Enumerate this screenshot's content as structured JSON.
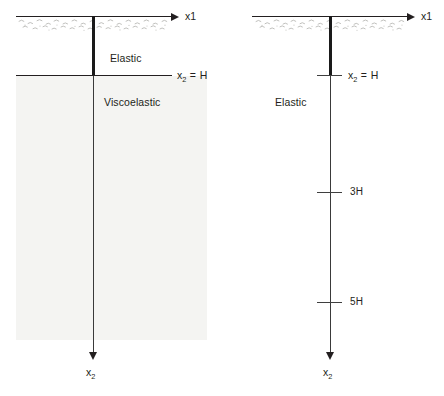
{
  "figure": {
    "background_color": "#ffffff",
    "line_color": "#231f20",
    "shade_color": "#f4f4f2"
  },
  "panels": [
    {
      "id": "left",
      "name": "elastic-layer-over-viscoelastic-halfspace",
      "axes": {
        "horizontal_label": "x1",
        "vertical_label_main": "x",
        "vertical_label_sub": "2"
      },
      "regions": [
        {
          "name": "elastic",
          "label": "Elastic",
          "shaded": false
        },
        {
          "name": "viscoelastic",
          "label": "Viscoelastic",
          "shaded": true
        }
      ],
      "interface": {
        "name": "depth-H-interface",
        "label_main": "x",
        "label_sub": "2",
        "label_eq": " = H",
        "style": "full-horizontal-line"
      },
      "ticks": []
    },
    {
      "id": "right",
      "name": "uniform-elastic-halfspace",
      "axes": {
        "horizontal_label": "x1",
        "vertical_label_main": "x",
        "vertical_label_sub": "2"
      },
      "regions": [
        {
          "name": "elastic",
          "label": "Elastic",
          "shaded": false
        }
      ],
      "interface": {
        "name": "depth-H-tick",
        "label_main": "x",
        "label_sub": "2",
        "label_eq": " = H",
        "style": "tick-mark"
      },
      "ticks": [
        {
          "name": "depth-3H-tick",
          "label": "3H"
        },
        {
          "name": "depth-5H-tick",
          "label": "5H"
        }
      ]
    }
  ]
}
